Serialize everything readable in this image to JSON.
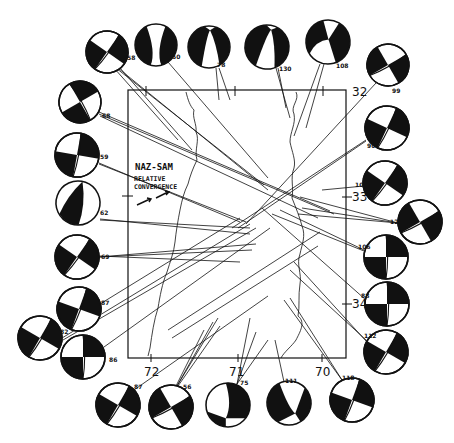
{
  "figure": {
    "type": "focal-mechanism-map",
    "annotation": {
      "line1": "NAZ-SAM",
      "line2": "RELATIVE",
      "line3": "CONVERGENCE"
    },
    "latitude_labels": [
      "32",
      "33",
      "34"
    ],
    "longitude_labels": [
      "72",
      "71",
      "70"
    ],
    "colors": {
      "ink": "#111111",
      "paper": "#ffffff"
    }
  },
  "mechanisms": [
    {
      "id": "58",
      "label": "58",
      "cx": 107,
      "cy": 52,
      "r": 21,
      "rot": 35,
      "type": "strike-slip"
    },
    {
      "id": "50",
      "label": "50",
      "cx": 156,
      "cy": 45,
      "r": 21,
      "rot": 0,
      "type": "reverse"
    },
    {
      "id": "78",
      "label": "78",
      "cx": 209,
      "cy": 47,
      "r": 21,
      "rot": 0,
      "type": "reverse-a"
    },
    {
      "id": "130",
      "label": "130",
      "cx": 267,
      "cy": 47,
      "r": 22,
      "rot": 10,
      "type": "reverse-a"
    },
    {
      "id": "108",
      "label": "108",
      "cx": 328,
      "cy": 42,
      "r": 22,
      "rot": -15,
      "type": "oblique"
    },
    {
      "id": "99",
      "label": "99",
      "cx": 388,
      "cy": 65,
      "r": 21,
      "rot": 60,
      "type": "strike-slip"
    },
    {
      "id": "68",
      "label": "68",
      "cx": 80,
      "cy": 102,
      "r": 21,
      "rot": -30,
      "type": "strike-slip"
    },
    {
      "id": "90",
      "label": "90",
      "cx": 387,
      "cy": 128,
      "r": 22,
      "rot": 25,
      "type": "strike-slip"
    },
    {
      "id": "59",
      "label": "59",
      "cx": 77,
      "cy": 155,
      "r": 22,
      "rot": 10,
      "type": "strike-slip"
    },
    {
      "id": "103",
      "label": "103",
      "cx": 385,
      "cy": 183,
      "r": 22,
      "rot": 35,
      "type": "strike-slip"
    },
    {
      "id": "62",
      "label": "62",
      "cx": 78,
      "cy": 203,
      "r": 22,
      "rot": -25,
      "type": "normal-ish"
    },
    {
      "id": "122",
      "label": "122",
      "cx": 420,
      "cy": 222,
      "r": 22,
      "rot": 60,
      "type": "strike-slip"
    },
    {
      "id": "69",
      "label": "69",
      "cx": 77,
      "cy": 257,
      "r": 22,
      "rot": 35,
      "type": "strike-slip"
    },
    {
      "id": "106",
      "label": "106",
      "cx": 386,
      "cy": 257,
      "r": 22,
      "rot": 0,
      "type": "strike-slip"
    },
    {
      "id": "87a",
      "label": "87",
      "cx": 79,
      "cy": 309,
      "r": 22,
      "rot": 20,
      "type": "strike-slip"
    },
    {
      "id": "88",
      "label": "88",
      "cx": 387,
      "cy": 304,
      "r": 22,
      "rot": 0,
      "type": "strike-slip"
    },
    {
      "id": "82",
      "label": "82",
      "cx": 40,
      "cy": 338,
      "r": 22,
      "rot": 30,
      "type": "strike-slip"
    },
    {
      "id": "86",
      "label": "86",
      "cx": 83,
      "cy": 357,
      "r": 22,
      "rot": 0,
      "type": "strike-slip"
    },
    {
      "id": "112",
      "label": "112",
      "cx": 386,
      "cy": 352,
      "r": 22,
      "rot": 30,
      "type": "strike-slip"
    },
    {
      "id": "87b",
      "label": "87",
      "cx": 118,
      "cy": 405,
      "r": 22,
      "rot": 30,
      "type": "strike-slip"
    },
    {
      "id": "56",
      "label": "56",
      "cx": 171,
      "cy": 407,
      "r": 22,
      "rot": 60,
      "type": "strike-slip"
    },
    {
      "id": "75",
      "label": "75",
      "cx": 228,
      "cy": 405,
      "r": 22,
      "rot": 0,
      "type": "reverse-b"
    },
    {
      "id": "111",
      "label": "111",
      "cx": 289,
      "cy": 403,
      "r": 22,
      "rot": -20,
      "type": "reverse-c"
    },
    {
      "id": "118",
      "label": "118",
      "cx": 352,
      "cy": 400,
      "r": 22,
      "rot": 20,
      "type": "strike-slip"
    }
  ]
}
